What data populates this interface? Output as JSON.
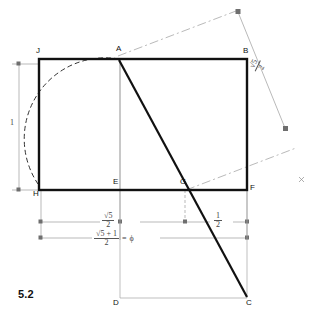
{
  "figure": {
    "number": "5.2",
    "points": [
      {
        "id": "J",
        "label": "J",
        "x": 38,
        "y": 58
      },
      {
        "id": "A",
        "label": "A",
        "x": 119,
        "y": 58
      },
      {
        "id": "B",
        "label": "B",
        "x": 247,
        "y": 58
      },
      {
        "id": "H",
        "label": "H",
        "x": 38,
        "y": 190
      },
      {
        "id": "E",
        "label": "E",
        "x": 119,
        "y": 190
      },
      {
        "id": "G",
        "label": "G",
        "x": 185,
        "y": 190
      },
      {
        "id": "F",
        "label": "F",
        "x": 247,
        "y": 190
      },
      {
        "id": "D",
        "label": "D",
        "x": 119,
        "y": 298
      },
      {
        "id": "C",
        "label": "C",
        "x": 247,
        "y": 298
      }
    ],
    "dimensions": {
      "left_height": "1",
      "half_root5": {
        "numerator": "√5",
        "denominator": "2"
      },
      "half": {
        "numerator": "1",
        "denominator": "2"
      },
      "phi_expression": {
        "numerator": "√5 + 1",
        "denominator": "2"
      },
      "phi_equals": "=",
      "phi_symbol": "ϕ",
      "diagonal": {
        "numerator": "√5",
        "denominator": "2"
      }
    },
    "colors": {
      "ink": "#111111",
      "construction": "#9a9a9a",
      "dimension": "#8c8c8c",
      "background": "#ffffff"
    }
  }
}
